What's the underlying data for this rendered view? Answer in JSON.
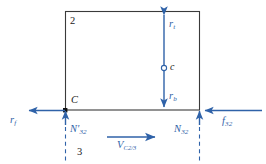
{
  "diagram": {
    "colors": {
      "line": "#3a3a3a",
      "vector": "#2f62a8",
      "point": "#000000",
      "background": "#ffffff"
    },
    "body": {
      "label": "2",
      "shape": "rectangle"
    },
    "ground": {
      "label": "3"
    },
    "points": [
      {
        "name": "contact-point",
        "label": "C"
      },
      {
        "name": "center-point",
        "label": "c"
      }
    ],
    "dimensions": [
      {
        "name": "radius-top",
        "label": "r",
        "sub": "t"
      },
      {
        "name": "radius-bottom",
        "label": "r",
        "sub": "b"
      }
    ],
    "forces": [
      {
        "name": "friction-force-left",
        "label": "r",
        "sub": "f",
        "prime": "",
        "direction": "left"
      },
      {
        "name": "friction-force-right",
        "label": "f",
        "sub": "32",
        "prime": "",
        "direction": "left"
      },
      {
        "name": "normal-force-left",
        "label": "N",
        "sub": "32",
        "prime": "'",
        "direction": "up"
      },
      {
        "name": "normal-force-right",
        "label": "N",
        "sub": "32",
        "prime": "",
        "direction": "up"
      }
    ],
    "velocity": {
      "name": "relative-velocity",
      "label": "V",
      "sub": "C2/3",
      "direction": "right"
    }
  }
}
